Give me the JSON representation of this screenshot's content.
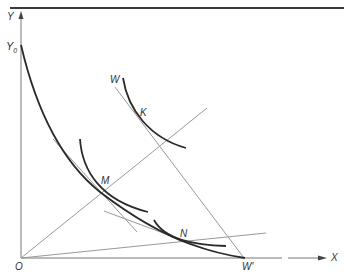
{
  "diagram": {
    "type": "economics-indifference-curve-diagram",
    "axes": {
      "x_label": "X",
      "y_label": "Y",
      "origin_label": "O"
    },
    "points": {
      "y0": {
        "label": "Y",
        "subscript": "0"
      },
      "w": {
        "label": "W"
      },
      "w_prime": {
        "label": "W′"
      },
      "k": {
        "label": "K"
      },
      "m": {
        "label": "M"
      },
      "n": {
        "label": "N"
      }
    },
    "colors": {
      "curve": "#2a2a2a",
      "thin_line": "#8a8a8a",
      "axis": "#555555",
      "label": "#333333",
      "rule": "#3a3a3a"
    }
  }
}
